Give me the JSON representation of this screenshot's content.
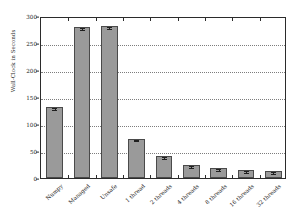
{
  "chart_data": {
    "type": "bar",
    "title": "",
    "xlabel": "",
    "ylabel": "Wall-Clock in Seconds",
    "ylim": [
      0,
      300
    ],
    "yticks": [
      0,
      50,
      100,
      150,
      200,
      250,
      300
    ],
    "ytick_labels": [
      "0",
      "50",
      "100",
      "150",
      "200",
      "250",
      "300"
    ],
    "grid": true,
    "legend": "none",
    "categories": [
      "Numpy",
      "Managed",
      "Unsafe",
      "1 thread",
      "2 threads",
      "4 threads",
      "8 threads",
      "16 threads",
      "32 threads"
    ],
    "values": [
      132,
      280,
      281,
      73,
      41,
      24,
      19,
      15,
      13
    ],
    "errors": [
      1.5,
      1.5,
      1.5,
      1.5,
      1.5,
      2.0,
      1.5,
      1.5,
      1.0
    ],
    "bar_color": "#9a9a9a",
    "bar_edge_color": "#4a4a4a",
    "grid_color": "#7d7d7d",
    "axis_color": "#2b2b2b",
    "text_color": "#1a1a1a"
  }
}
